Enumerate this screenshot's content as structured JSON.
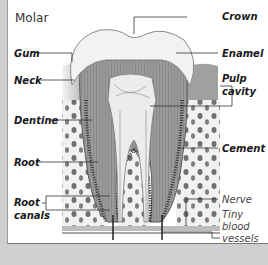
{
  "diagram": {
    "title": "Molar",
    "type": "labeled anatomical cross-section",
    "labels_left": [
      {
        "id": "gum",
        "text": "Gum"
      },
      {
        "id": "neck",
        "text": "Neck"
      },
      {
        "id": "dentine",
        "text": "Dentine"
      },
      {
        "id": "root",
        "text": "Root"
      },
      {
        "id": "root-canals",
        "line1": "Root",
        "line2": "canals"
      }
    ],
    "labels_right": [
      {
        "id": "crown",
        "text": "Crown"
      },
      {
        "id": "enamel",
        "text": "Enamel"
      },
      {
        "id": "pulp-cavity",
        "line1": "Pulp",
        "line2": "cavity"
      },
      {
        "id": "cement",
        "text": "Cement"
      },
      {
        "id": "nerve",
        "text": "Nerve"
      },
      {
        "id": "tiny-blood-vessels",
        "line1": "Tiny",
        "line2": "blood",
        "line3": "vessels"
      }
    ],
    "colors": {
      "frame": "#cfcfcf",
      "panel": "#ffffff",
      "enamel": "#f2f2f2",
      "dentine": "#8c8c8c",
      "pulp": "#e8e8e8",
      "gum": "#9d9d9d",
      "bone_spots": "#6f6f6f",
      "leader_line": "#333333"
    }
  }
}
